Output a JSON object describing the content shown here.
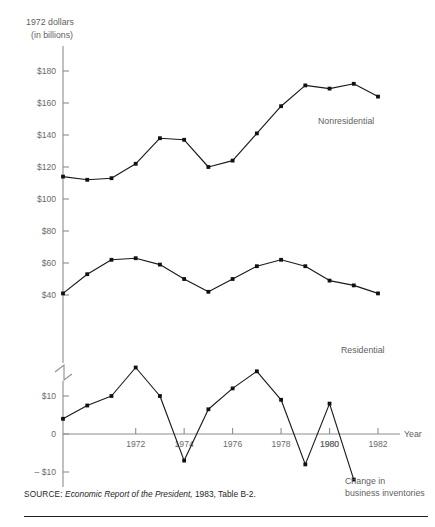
{
  "axis": {
    "y_title_line1": "1972 dollars",
    "y_title_line2": "(in billions)",
    "x_title": "Year",
    "y_ticks_upper": [
      "$180",
      "$160",
      "$140",
      "$120",
      "$100",
      "$80",
      "$60",
      "$40"
    ],
    "y_ticks_lower": [
      "$10",
      "0",
      "– $10"
    ],
    "x_ticks": [
      "1972",
      "1974",
      "1976",
      "1978",
      "1980",
      "1982"
    ]
  },
  "labels": {
    "nonresidential": "Nonresidential",
    "residential": "Residential",
    "inventories_line1": "Change in",
    "inventories_line2": "business inventories"
  },
  "source": {
    "keyword": "SOURCE:",
    "title": "Economic Report of the President,",
    "rest": " 1983, Table B-2."
  },
  "chart_data": {
    "type": "line",
    "title": "",
    "xlabel": "Year",
    "ylabel": "1972 dollars (in billions)",
    "grid": false,
    "legend": "inline-right",
    "axis_break": true,
    "x": [
      1969,
      1970,
      1971,
      1972,
      1973,
      1974,
      1975,
      1976,
      1977,
      1978,
      1979,
      1980,
      1981,
      1982
    ],
    "xlim": [
      1969,
      1982
    ],
    "upper_axis": {
      "ylim": [
        30,
        190
      ],
      "ticks": [
        40,
        60,
        80,
        100,
        120,
        140,
        160,
        180
      ]
    },
    "lower_axis": {
      "ylim": [
        -14,
        20
      ],
      "ticks": [
        -10,
        0,
        10
      ]
    },
    "series": [
      {
        "name": "Nonresidential",
        "axis": "upper",
        "values": [
          114,
          112,
          113,
          122,
          138,
          137,
          120,
          124,
          141,
          158,
          171,
          169,
          172,
          164
        ]
      },
      {
        "name": "Residential",
        "axis": "upper",
        "values": [
          41,
          53,
          62,
          63,
          59,
          50,
          42,
          50,
          58,
          62,
          58,
          49,
          46,
          41
        ]
      },
      {
        "name": "Change in business inventories",
        "axis": "lower",
        "values": [
          4,
          7.5,
          10,
          17.5,
          10,
          -7,
          6.5,
          12,
          16.5,
          9,
          -8,
          8,
          -12,
          null
        ]
      }
    ]
  }
}
